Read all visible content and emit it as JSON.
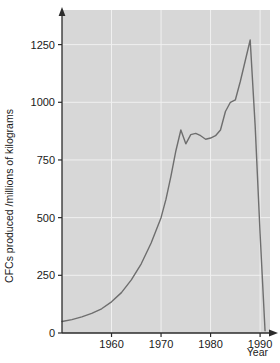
{
  "chart_data": {
    "type": "line",
    "title": "",
    "xlabel": "Year",
    "ylabel": "CFCs produced /millions of kilograms",
    "xlim": [
      1950,
      1992
    ],
    "ylim": [
      0,
      1400
    ],
    "grid": true,
    "legend": false,
    "legend_position": "none",
    "xticks": [
      1960,
      1970,
      1980,
      1990
    ],
    "xtick_labels": [
      "1960",
      "1970",
      "1980",
      "1990"
    ],
    "yticks": [
      0,
      250,
      500,
      750,
      1000,
      1250
    ],
    "ytick_labels": [
      "0",
      "250",
      "500",
      "750",
      "1000",
      "1250"
    ],
    "series": [
      {
        "name": "CFCs produced",
        "x": [
          1950,
          1952,
          1954,
          1956,
          1958,
          1960,
          1962,
          1964,
          1966,
          1968,
          1970,
          1971,
          1972,
          1973,
          1974,
          1975,
          1976,
          1977,
          1978,
          1979,
          1980,
          1981,
          1982,
          1983,
          1984,
          1985,
          1986,
          1987,
          1988,
          1989,
          1990,
          1991
        ],
        "y": [
          50,
          58,
          70,
          85,
          105,
          135,
          175,
          230,
          300,
          390,
          500,
          580,
          680,
          790,
          880,
          820,
          860,
          865,
          855,
          840,
          845,
          855,
          880,
          960,
          1000,
          1010,
          1090,
          1180,
          1270,
          900,
          430,
          10
        ]
      }
    ],
    "annotations": [],
    "colors": {
      "plot_background": "#d7d7d7",
      "figure_background": "#ffffff",
      "gridline": "#f0f0f0",
      "line": "#6e6e6e",
      "axis": "#2b2b2b",
      "text": "#1a1a1a"
    }
  },
  "axis_labels": {
    "y_title": "CFCs produced /millions of kilograms",
    "x_title": "Year"
  }
}
